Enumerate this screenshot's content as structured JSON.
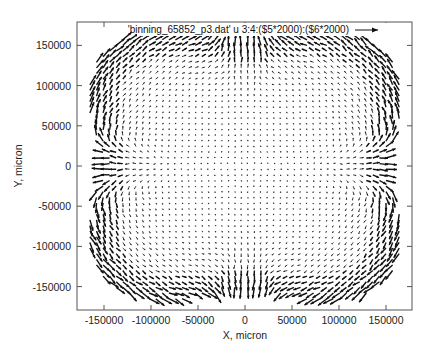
{
  "chart_data": {
    "type": "vector_field",
    "title": "",
    "xlabel": "X, micron",
    "ylabel": "Y, micron",
    "xlim": [
      -180000,
      178000
    ],
    "ylim": [
      -180000,
      180000
    ],
    "xticks": [
      -150000,
      -100000,
      -50000,
      0,
      50000,
      100000,
      150000
    ],
    "xtick_labels": [
      "-150000",
      "-100000",
      "-50000",
      "0",
      "50000",
      "100000",
      "150000"
    ],
    "yticks": [
      150000,
      100000,
      50000,
      0,
      -50000,
      -100000,
      -150000
    ],
    "ytick_labels": [
      "150000",
      "100000",
      "50000",
      "0",
      "-50000",
      "-100000",
      "-150000"
    ],
    "grid": false,
    "legend": {
      "position": "top-right-inside",
      "entries": [
        "'binning_65852_p3.dat' u 3:4:($5*2000):($6*2000)"
      ]
    },
    "series": [
      {
        "name": "'binning_65852_p3.dat' u 3:4:($5*2000):($6*2000)",
        "style": "vectors",
        "color": "#000000",
        "grid_step_micron": 7000,
        "domain_shape": "rounded square with concave waist on all four sides (clover-like)",
        "domain_half_width_micron": 165000,
        "description": "Displacement vectors scaled x2000; strong circulating flow near the boundary in four corner lobes, converging toward the mid-sides (x≈±160000,y≈0 and x≈0,y≈±160000), near-zero vectors in the central region"
      }
    ]
  },
  "colors": {
    "background": "#ffffff",
    "frame": "#555555",
    "arrows": "#111111",
    "text": "#222222"
  }
}
